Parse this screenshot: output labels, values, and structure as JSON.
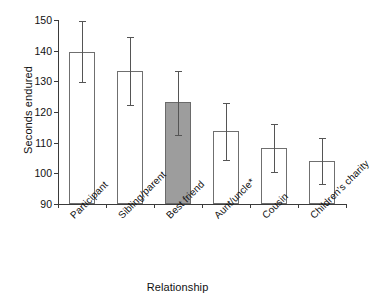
{
  "chart_data": {
    "type": "bar",
    "title": "",
    "xlabel": "Relationship",
    "ylabel": "Seconds endured",
    "categories": [
      "Participant",
      "Sibling/parent",
      "Best friend",
      "Aunt/uncle*",
      "Cousin",
      "Children's charity"
    ],
    "values": [
      139.7,
      133.3,
      123.3,
      113.9,
      108.3,
      104.0
    ],
    "error_low": [
      129.8,
      122.2,
      112.6,
      104.4,
      100.4,
      96.4
    ],
    "error_high": [
      149.6,
      144.3,
      133.5,
      123.0,
      116.0,
      111.5
    ],
    "ylim": [
      90,
      150
    ],
    "yticks": [
      90,
      100,
      110,
      120,
      130,
      140,
      150
    ],
    "ytick_labels": [
      "90",
      "100",
      "110",
      "120",
      "130",
      "140",
      "150"
    ],
    "grid": false,
    "legend": "none",
    "highlight_index": 2,
    "bar_fill_default": "#ffffff",
    "bar_fill_highlight": "#9d9d9d",
    "bar_edge_color": "#6f6f6f",
    "error_bar_color": "#555555",
    "axis_color": "#3a3a3a",
    "background": "#ffffff"
  }
}
